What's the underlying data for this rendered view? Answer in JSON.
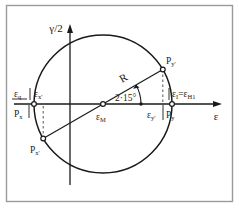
{
  "figure": {
    "type": "mohr-circle-strain-diagram",
    "frame_color": "#9a9a9a",
    "line_color": "#1a1a1a",
    "background": "#ffffff"
  },
  "axes": {
    "vertical_label": "γ/2",
    "horizontal_label": "ε",
    "origin_x": 70,
    "origin_y": 104
  },
  "circle": {
    "center_x": 103,
    "center_y": 104,
    "radius": 69,
    "center_label": "ε",
    "center_label_sub": "M"
  },
  "angle": {
    "label": "2·15°",
    "value_deg": 30
  },
  "radius_label": "R",
  "points": [
    {
      "name": "point-Pz",
      "label": "P",
      "label_sub": "x",
      "x": 34,
      "y": 104
    },
    {
      "name": "point-Py",
      "label": "P",
      "label_sub": "y",
      "x": 172,
      "y": 104
    },
    {
      "name": "point-Px-prime",
      "label": "P",
      "label_sub": "x'",
      "x": 43,
      "y": 139
    },
    {
      "name": "point-Py-prime",
      "label": "P",
      "label_sub": "y'",
      "x": 163,
      "y": 69
    }
  ],
  "axis_labels": [
    {
      "name": "label-eps-II",
      "text": "ε",
      "sub": "q",
      "x": 17,
      "y": 96
    },
    {
      "name": "label-eps-x-prime",
      "text": "ε",
      "sub": "x'",
      "x": 38,
      "y": 96
    },
    {
      "name": "label-eps-y-prime",
      "text": "ε",
      "sub": "y'",
      "x": 151,
      "y": 114
    },
    {
      "name": "label-eps-1",
      "text": "ε",
      "sub": "I",
      "x": 174,
      "y": 96
    }
  ],
  "eps_one_equation": {
    "lhs": "ε",
    "lhs_sub": "I",
    "eq": "=",
    "rhs": "ε",
    "rhs_sub": "H1"
  },
  "center_marker_label": {
    "text": "ε",
    "sub": "M"
  }
}
